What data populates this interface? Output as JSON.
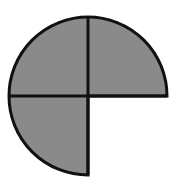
{
  "diagram": {
    "type": "fraction-circle",
    "total_parts": 4,
    "shaded_parts": 3,
    "unshaded_quadrant": "bottom-right",
    "colors": {
      "fill": "#8a8a8a",
      "stroke": "#111111",
      "background": "#ffffff"
    },
    "geometry": {
      "cx": 88,
      "cy": 96,
      "r": 79
    }
  }
}
